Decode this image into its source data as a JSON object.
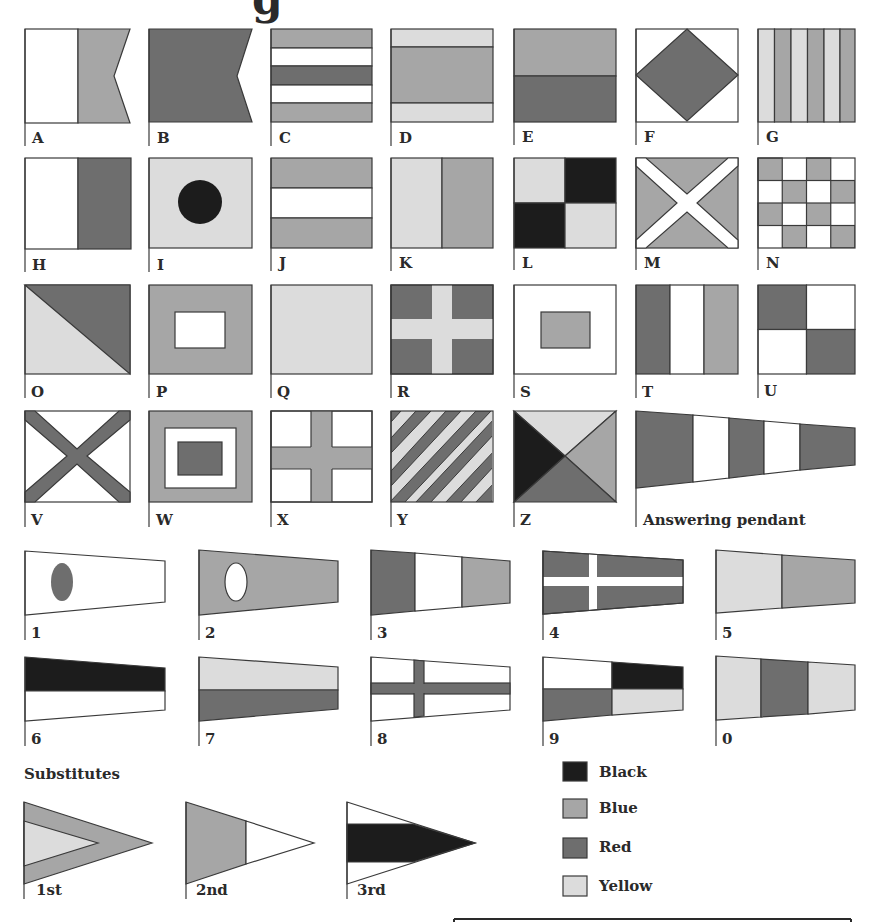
{
  "title_fragment": "g",
  "colors": {
    "black": "#1c1c1c",
    "blue": "#a6a6a6",
    "red": "#6e6e6e",
    "yellow": "#dcdcdc",
    "white": "#ffffff",
    "outline": "#3a3a3a"
  },
  "letter_flags": [
    {
      "label": "A"
    },
    {
      "label": "B"
    },
    {
      "label": "C"
    },
    {
      "label": "D"
    },
    {
      "label": "E"
    },
    {
      "label": "F"
    },
    {
      "label": "G"
    },
    {
      "label": "H"
    },
    {
      "label": "I"
    },
    {
      "label": "J"
    },
    {
      "label": "K"
    },
    {
      "label": "L"
    },
    {
      "label": "M"
    },
    {
      "label": "N"
    },
    {
      "label": "O"
    },
    {
      "label": "P"
    },
    {
      "label": "Q"
    },
    {
      "label": "R"
    },
    {
      "label": "S"
    },
    {
      "label": "T"
    },
    {
      "label": "U"
    },
    {
      "label": "V"
    },
    {
      "label": "W"
    },
    {
      "label": "X"
    },
    {
      "label": "Y"
    },
    {
      "label": "Z"
    }
  ],
  "answering_pendant": {
    "label": "Answering pendant"
  },
  "numeral_pennants": [
    {
      "label": "1"
    },
    {
      "label": "2"
    },
    {
      "label": "3"
    },
    {
      "label": "4"
    },
    {
      "label": "5"
    },
    {
      "label": "6"
    },
    {
      "label": "7"
    },
    {
      "label": "8"
    },
    {
      "label": "9"
    },
    {
      "label": "0"
    }
  ],
  "substitutes": {
    "heading": "Substitutes",
    "items": [
      {
        "label": "1st"
      },
      {
        "label": "2nd"
      },
      {
        "label": "3rd"
      }
    ]
  },
  "legend": [
    {
      "label": "Black",
      "color": "#1c1c1c"
    },
    {
      "label": "Blue",
      "color": "#a6a6a6"
    },
    {
      "label": "Red",
      "color": "#6e6e6e"
    },
    {
      "label": "Yellow",
      "color": "#dcdcdc"
    }
  ]
}
